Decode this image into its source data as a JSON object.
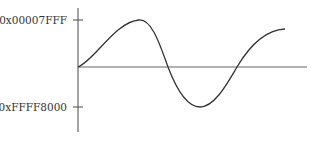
{
  "figure": {
    "type": "waveform-diagram",
    "y_axis": {
      "labels": {
        "max": "0x00007FFF",
        "min": "0xFFFF8000"
      }
    },
    "colors": {
      "axis": "#555555",
      "curve": "#333333",
      "text": "#333333"
    },
    "curve_points": [
      [
        78,
        67
      ],
      [
        139,
        20
      ],
      [
        168,
        67
      ],
      [
        200,
        107
      ],
      [
        237,
        67
      ],
      [
        285,
        29
      ]
    ]
  }
}
